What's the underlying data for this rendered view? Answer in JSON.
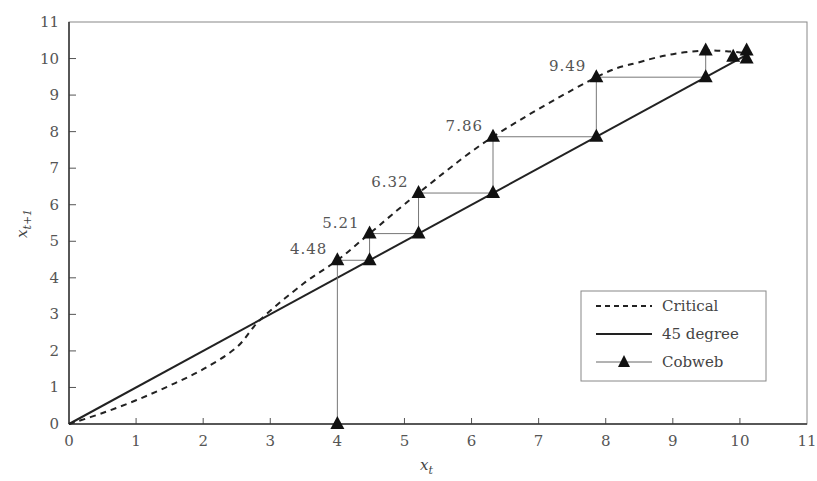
{
  "chart_data": {
    "type": "line",
    "title": "",
    "xlabel": "x_t",
    "ylabel": "x_{t+1}",
    "xlim": [
      0,
      11
    ],
    "ylim": [
      0,
      11
    ],
    "xticks": [
      0,
      1,
      2,
      3,
      4,
      5,
      6,
      7,
      8,
      9,
      10,
      11
    ],
    "yticks": [
      0,
      1,
      2,
      3,
      4,
      5,
      6,
      7,
      8,
      9,
      10,
      11
    ],
    "grid": false,
    "legend_position": "lower right",
    "series": [
      {
        "name": "Critical",
        "style": "dashed",
        "x": [
          0,
          0.5,
          1,
          1.5,
          2,
          2.5,
          2.85,
          3.5,
          4,
          4.48,
          5.21,
          6.32,
          7.86,
          8.5,
          9,
          9.49,
          9.8,
          10.1
        ],
        "y": [
          0,
          0.3,
          0.65,
          1.05,
          1.5,
          2.1,
          2.85,
          3.85,
          4.48,
          5.21,
          6.32,
          7.86,
          9.49,
          9.9,
          10.12,
          10.22,
          10.2,
          10.15
        ]
      },
      {
        "name": "45 degree",
        "style": "solid",
        "x": [
          0,
          10.1
        ],
        "y": [
          0,
          10.1
        ]
      },
      {
        "name": "Cobweb",
        "style": "thin-line-triangle-markers",
        "x": [
          4,
          4,
          4.48,
          4.48,
          5.21,
          5.21,
          6.32,
          6.32,
          7.86,
          7.86,
          9.49,
          9.49,
          9.9,
          10.1,
          10.1
        ],
        "y": [
          0,
          4.48,
          4.48,
          5.21,
          5.21,
          6.32,
          6.32,
          7.86,
          7.86,
          9.49,
          9.49,
          10.22,
          10.05,
          10.0,
          10.22
        ]
      }
    ],
    "annotations": [
      {
        "text": "4.48",
        "x": 4,
        "y": 4.48
      },
      {
        "text": "5.21",
        "x": 4.48,
        "y": 5.21
      },
      {
        "text": "6.32",
        "x": 5.21,
        "y": 6.32
      },
      {
        "text": "7.86",
        "x": 6.32,
        "y": 7.86
      },
      {
        "text": "9.49",
        "x": 7.86,
        "y": 9.49
      }
    ]
  },
  "axes": {
    "x_title": "x",
    "x_sub": "t",
    "y_title": "x",
    "y_sub": "t+1"
  },
  "legend": {
    "items": [
      {
        "label": "Critical"
      },
      {
        "label": "45 degree"
      },
      {
        "label": "Cobweb"
      }
    ]
  }
}
